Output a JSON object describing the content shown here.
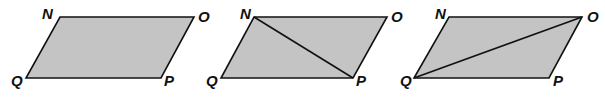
{
  "figures": [
    {
      "name": "parallelogram-NOPQ",
      "vertices": {
        "N": [
          60,
          17
        ],
        "O": [
          194,
          17
        ],
        "P": [
          161,
          78
        ],
        "Q": [
          26,
          78
        ]
      },
      "labels": {
        "N": "N",
        "O": "O",
        "P": "P",
        "Q": "Q"
      },
      "diagonal": null
    },
    {
      "name": "parallelogram-NOPQ-diagonal-NP",
      "vertices": {
        "N": [
          254,
          17
        ],
        "O": [
          387,
          17
        ],
        "P": [
          353,
          78
        ],
        "Q": [
          221,
          78
        ]
      },
      "labels": {
        "N": "N",
        "O": "O",
        "P": "P",
        "Q": "Q"
      },
      "diagonal": [
        "N",
        "P"
      ]
    },
    {
      "name": "parallelogram-NOPQ-diagonal-QO",
      "vertices": {
        "N": [
          449,
          17
        ],
        "O": [
          582,
          17
        ],
        "P": [
          549,
          78
        ],
        "Q": [
          414,
          78
        ]
      },
      "labels": {
        "N": "N",
        "O": "O",
        "P": "P",
        "Q": "Q"
      },
      "diagonal": [
        "Q",
        "O"
      ]
    }
  ],
  "colors": {
    "fill": "#c4c4c4",
    "stroke": "#111111"
  }
}
